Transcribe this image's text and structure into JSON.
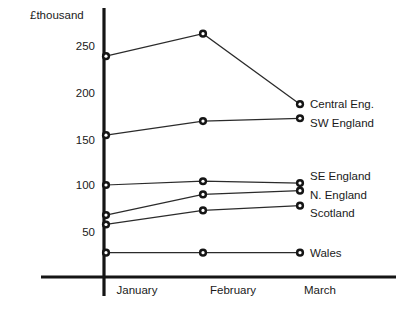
{
  "chart_data": {
    "type": "line",
    "title": "",
    "subtitle": "",
    "xlabel": "",
    "ylabel": "£thousand",
    "unit_label": "£thousand",
    "categories": [
      "January",
      "February",
      "March"
    ],
    "x": [
      "January",
      "February",
      "March"
    ],
    "ylim": [
      0,
      275
    ],
    "y_ticks": [
      50,
      100,
      150,
      200,
      250
    ],
    "y_tick_labels": [
      "50",
      "100",
      "150",
      "200",
      "250"
    ],
    "grid": false,
    "legend_position": "right-inline",
    "series": [
      {
        "name": "Central Eng.",
        "label": "Central Eng.",
        "values": [
          237,
          261,
          186
        ]
      },
      {
        "name": "SW England",
        "label": "SW England",
        "values": [
          153,
          168,
          171
        ]
      },
      {
        "name": "SE England",
        "label": "SE England",
        "values": [
          100,
          104,
          102
        ]
      },
      {
        "name": "N. England",
        "label": "N. England",
        "values": [
          68,
          90,
          94
        ]
      },
      {
        "name": "Scotland",
        "label": "Scotland",
        "values": [
          58,
          73,
          78
        ]
      },
      {
        "name": "Wales",
        "label": "Wales",
        "values": [
          28,
          28,
          28
        ]
      }
    ]
  },
  "axis": {
    "unit_label": "£thousand",
    "y_tick_250": "250",
    "y_tick_200": "200",
    "y_tick_150": "150",
    "y_tick_100": "100",
    "y_tick_50": "50",
    "x_tick_january": "January",
    "x_tick_february": "February",
    "x_tick_march": "March"
  },
  "series_labels": {
    "central_eng": "Central Eng.",
    "sw_england": "SW England",
    "se_england": "SE England",
    "n_england": "N. England",
    "scotland": "Scotland",
    "wales": "Wales"
  },
  "colors": {
    "axis": "#151515",
    "line": "#2b2b2b",
    "marker_fill": "#151515",
    "marker_center": "#ffffff",
    "background": "#ffffff",
    "text": "#1a1a1a"
  }
}
